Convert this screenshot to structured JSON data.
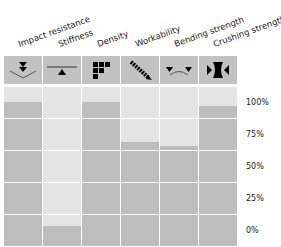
{
  "chart_data": {
    "type": "table",
    "title": "",
    "categories": [
      "Impact resistance",
      "Stiffness",
      "Density",
      "Workability",
      "Bending strength",
      "Crushing strength"
    ],
    "icons": [
      "impact-icon",
      "stiffness-icon",
      "density-icon",
      "workability-icon",
      "bending-icon",
      "crushing-icon"
    ],
    "values": [
      90,
      12.5,
      90,
      65,
      62.5,
      87.5
    ],
    "ylabel": "",
    "yticks": [
      "100%",
      "75%",
      "50%",
      "25%",
      "0%"
    ],
    "ylim": [
      0,
      100
    ],
    "grid": true,
    "colors": {
      "fill": "#bdbdbd",
      "empty": "#e4e4e4",
      "header": "#c2c2c2"
    }
  }
}
